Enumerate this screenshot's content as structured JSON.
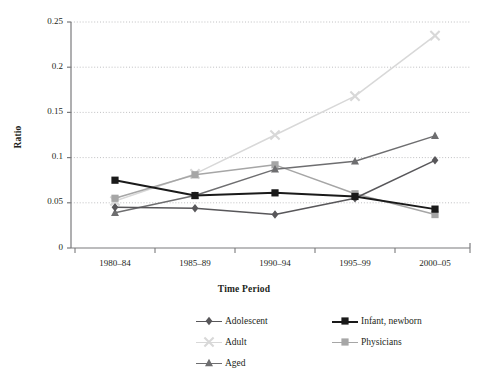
{
  "chart_data": {
    "type": "line",
    "title": "",
    "xlabel": "Time Period",
    "ylabel": "Ratio",
    "categories": [
      "1980–84",
      "1985–89",
      "1990–94",
      "1995–99",
      "2000–05"
    ],
    "ylim": [
      0,
      0.25
    ],
    "yticks": [
      0,
      0.05,
      0.1,
      0.15,
      0.2,
      0.25
    ],
    "ytick_labels": [
      "0",
      "0.05",
      "0.1",
      "0.15",
      "0.2",
      "0.25"
    ],
    "grid": "horizontal-dotted",
    "legend_position": "bottom-right",
    "series": [
      {
        "name": "Adolescent",
        "values": [
          0.045,
          0.044,
          0.037,
          0.055,
          0.097
        ],
        "color": "#58575a",
        "marker": "diamond"
      },
      {
        "name": "Infant, newborn",
        "values": [
          0.075,
          0.058,
          0.061,
          0.057,
          0.043
        ],
        "color": "#1a1a1a",
        "marker": "square"
      },
      {
        "name": "Adult",
        "values": [
          0.052,
          0.082,
          0.125,
          0.168,
          0.235
        ],
        "color": "#d8d8d8",
        "marker": "cross"
      },
      {
        "name": "Physicians",
        "values": [
          0.055,
          0.081,
          0.092,
          0.06,
          0.037
        ],
        "color": "#a6a6a6",
        "marker": "square"
      },
      {
        "name": "Aged",
        "values": [
          0.039,
          0.058,
          0.087,
          0.096,
          0.124
        ],
        "color": "#6e6e70",
        "marker": "triangle"
      }
    ]
  },
  "axes": {
    "y_title": "Ratio",
    "x_title": "Time Period"
  },
  "legend": {
    "entries": [
      {
        "label": "Adolescent"
      },
      {
        "label": "Infant, newborn"
      },
      {
        "label": "Adult"
      },
      {
        "label": "Physicians"
      },
      {
        "label": "Aged"
      }
    ]
  }
}
